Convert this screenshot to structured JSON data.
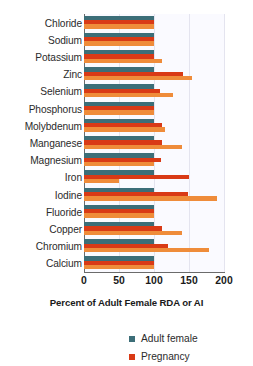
{
  "chart_data": {
    "type": "bar",
    "orientation": "horizontal",
    "title": "",
    "xlabel": "Percent of Adult Female RDA or AI",
    "ylabel": "",
    "xlim": [
      0,
      200
    ],
    "xticks": [
      0,
      50,
      100,
      150,
      200
    ],
    "xtick_labels": [
      "0",
      "50",
      "100",
      "150",
      "200"
    ],
    "grid": true,
    "grid_axis": "x",
    "legend_position": "bottom",
    "categories": [
      "Chloride",
      "Sodium",
      "Potassium",
      "Zinc",
      "Selenium",
      "Phosphorus",
      "Molybdenum",
      "Manganese",
      "Magnesium",
      "Iron",
      "Iodine",
      "Fluoride",
      "Copper",
      "Chromium",
      "Calcium"
    ],
    "series": [
      {
        "name": "Adult female",
        "color": "#3c6e78",
        "values": [
          100,
          100,
          100,
          100,
          100,
          100,
          100,
          100,
          100,
          100,
          100,
          100,
          100,
          100,
          100
        ]
      },
      {
        "name": "Pregnancy",
        "color": "#d93a16",
        "values": [
          100,
          100,
          100,
          141,
          109,
          100,
          111,
          111,
          110,
          150,
          148,
          100,
          111,
          120,
          100
        ]
      },
      {
        "name": "Lactation",
        "color": "#ef8c3a",
        "values": [
          100,
          100,
          112,
          154,
          127,
          100,
          115,
          140,
          100,
          50,
          190,
          100,
          140,
          178,
          100
        ]
      }
    ]
  },
  "legend": {
    "entries": [
      {
        "label": "Adult female",
        "color": "#3c6e78"
      },
      {
        "label": "Pregnancy",
        "color": "#d93a16"
      }
    ]
  }
}
